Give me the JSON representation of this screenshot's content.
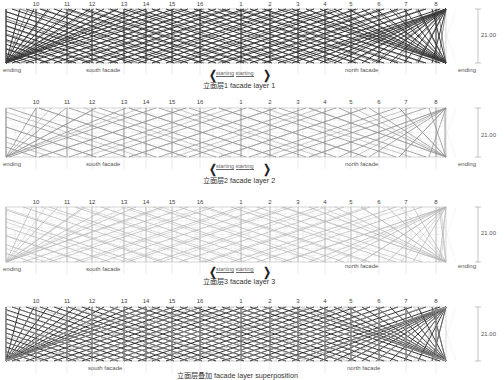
{
  "grid_numbers": [
    "10",
    "11",
    "12",
    "13",
    "14",
    "15",
    "16",
    "1",
    "2",
    "3",
    "4",
    "5",
    "6",
    "7",
    "8"
  ],
  "dimension": "21.00",
  "labels": {
    "ending": "ending",
    "south": "south facade",
    "north": "north facade",
    "starting_left": "starting",
    "starting_right": "starting"
  },
  "panels": [
    {
      "title": "立面层1  facade layer 1",
      "style": "dark"
    },
    {
      "title": "立面层2  facade layer 2",
      "style": "medium"
    },
    {
      "title": "立面层3  facade layer 3",
      "style": "light"
    },
    {
      "title": "立面层叠加  facade layer superposition",
      "style": "super"
    }
  ]
}
